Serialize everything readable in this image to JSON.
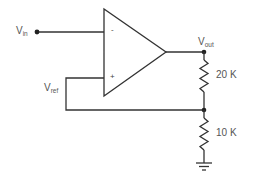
{
  "diagram": {
    "type": "op-amp circuit schematic",
    "input": {
      "label_main": "V",
      "label_sub": "in"
    },
    "reference": {
      "label_main": "V",
      "label_sub": "ref"
    },
    "output": {
      "label_main": "V",
      "label_sub": "out"
    },
    "opamp": {
      "inverting_sign": "-",
      "noninverting_sign": "+"
    },
    "resistors": [
      {
        "name": "R1",
        "label": "20 K"
      },
      {
        "name": "R2",
        "label": "10 K"
      }
    ],
    "colors": {
      "wire": "#333333",
      "text": "#555555",
      "background": "#ffffff"
    }
  }
}
